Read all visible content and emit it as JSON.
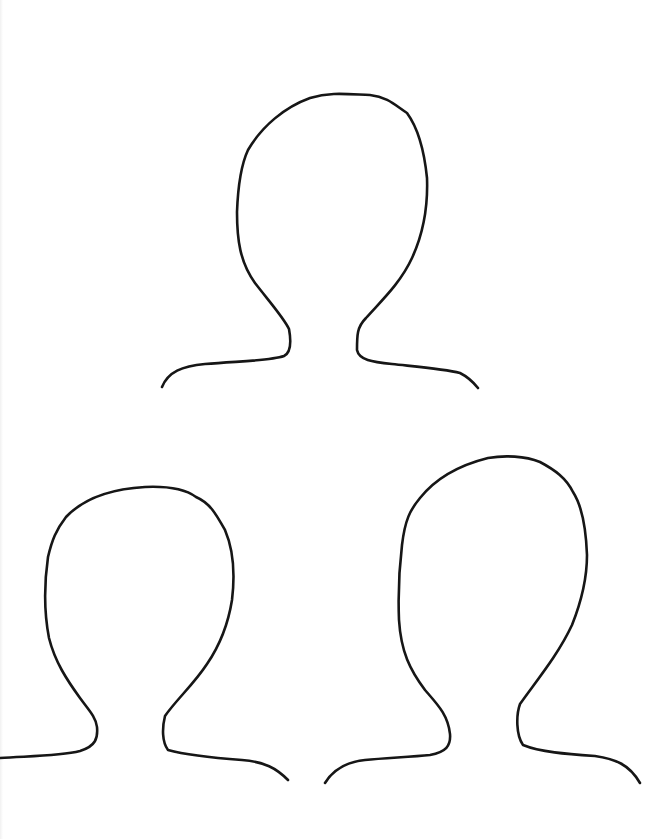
{
  "page": {
    "background": "#ffffff",
    "stroke_color": "#161616"
  },
  "figures": [
    {
      "name": "head-outline-top",
      "path": "M162,387 C168,372 182,366 205,364 C240,361 270,361 284,356 C292,352 291,340 289,329 C284,318 268,300 255,283 C240,262 237,240 237,212 C238,185 241,165 248,150 C262,126 285,107 310,98 C330,92 345,94 370,95 C388,97 396,106 407,113 C418,128 424,148 427,178 C428,205 424,232 412,258 C400,284 380,302 366,318 C357,327 357,335 357,350 C359,360 372,362 392,364 C420,367 445,369 460,373 C468,377 474,383 478,388"
    },
    {
      "name": "head-outline-bottom-left",
      "path": "M0,758 C30,756 60,756 80,751 C96,746 98,738 97,727 C96,717 88,709 80,698 C67,680 55,662 49,638 C44,612 44,585 48,557 C52,540 56,530 66,517 C84,498 110,489 145,487 C168,486 185,489 196,497 C210,503 216,514 225,530 C234,551 235,575 232,600 C228,625 218,648 207,664 C194,684 176,700 165,716 C162,728 162,742 168,750 C186,755 215,758 242,760 C265,762 276,768 288,780"
    },
    {
      "name": "head-outline-bottom-right",
      "path": "M325,783 C333,770 345,762 365,760 C385,758 410,757 430,755 C446,752 451,746 450,734 C448,715 438,705 425,690 C410,670 401,652 399,620 C398,595 399,570 402,545 C405,520 410,510 420,498 C436,478 460,465 488,458 C505,455 525,456 540,462 C555,470 566,478 573,492 C582,506 586,528 587,555 C587,580 580,605 572,625 C558,655 537,680 520,704 C516,715 516,735 523,745 C540,752 566,754 595,756 C615,759 629,764 640,783"
    }
  ]
}
